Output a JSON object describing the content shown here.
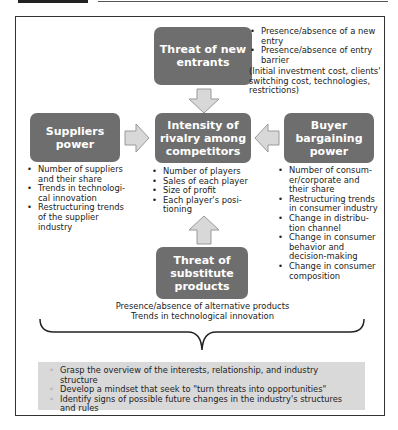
{
  "diagram": {
    "center": {
      "label": "Intensity of rivalry among competitors",
      "items": [
        "Number of players",
        "Sales of each player",
        "Size of profit",
        "Each player's posi-tioning"
      ]
    },
    "top": {
      "label": "Threat of new entrants",
      "items": [
        "Presence/absence of a new entry",
        "Presence/absence of entry barrier"
      ],
      "note": "(Initial investment cost, clients' switching cost, technologies, restrictions)"
    },
    "left": {
      "label": "Suppliers power",
      "items": [
        "Number of suppliers and their share",
        "Trends in technologi-cal innovation",
        "Restructuring trends of the supplier industry"
      ]
    },
    "right": {
      "label": "Buyer bargaining power",
      "items": [
        "Number of consum-er/corporate and their share",
        "Restructuring trends in consumer industry",
        "Change in distribu-tion channel",
        "Change in consumer behavior and decision-making",
        "Change in consumer composition"
      ]
    },
    "bottom": {
      "label": "Threat of substitute products",
      "lines": [
        "Presence/absence of alternative products",
        "Trends in technological innovation"
      ]
    },
    "summary": [
      "Grasp the overview of the interests, relationship, and industry structure",
      "Develop a mindset that seek to \"turn threats into opportunities\"",
      "Identify signs of possible future changes in the industry's structures and rules"
    ],
    "colors": {
      "box": "#6e6e6e",
      "arrow_fill": "#d8d8d8",
      "arrow_stroke": "#999999",
      "summary_bg": "#d9d9d9",
      "frame": "#333333"
    }
  }
}
